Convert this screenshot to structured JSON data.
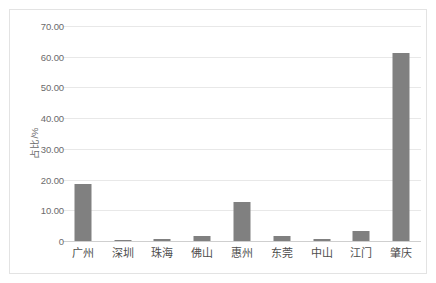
{
  "chart_data": {
    "type": "bar",
    "title": "",
    "subtitle": "",
    "xlabel": "",
    "ylabel": "占比/%",
    "categories": [
      "广州",
      "深圳",
      "珠海",
      "佛山",
      "惠州",
      "东莞",
      "中山",
      "江门",
      "肇庆"
    ],
    "values": [
      18.5,
      0.2,
      0.8,
      1.6,
      12.7,
      1.5,
      0.8,
      3.3,
      61.3
    ],
    "series": [
      {
        "name": "占比",
        "values": [
          18.5,
          0.2,
          0.8,
          1.6,
          12.7,
          1.5,
          0.8,
          3.3,
          61.3
        ]
      }
    ],
    "ylim": [
      0,
      70
    ],
    "yticks": [
      0,
      10,
      20,
      30,
      40,
      50,
      60,
      70
    ],
    "ytick_labels": [
      "0",
      "10.00",
      "20.00",
      "30.00",
      "40.00",
      "50.00",
      "60.00",
      "70.00"
    ],
    "grid": true,
    "legend": false,
    "legend_position": "none",
    "bar_color": "#808080",
    "gridline_color": "#e8e8e8",
    "axis_color": "#cfcfcf",
    "border_color": "#e3e3e3",
    "text_color": "#6b6b6b"
  }
}
